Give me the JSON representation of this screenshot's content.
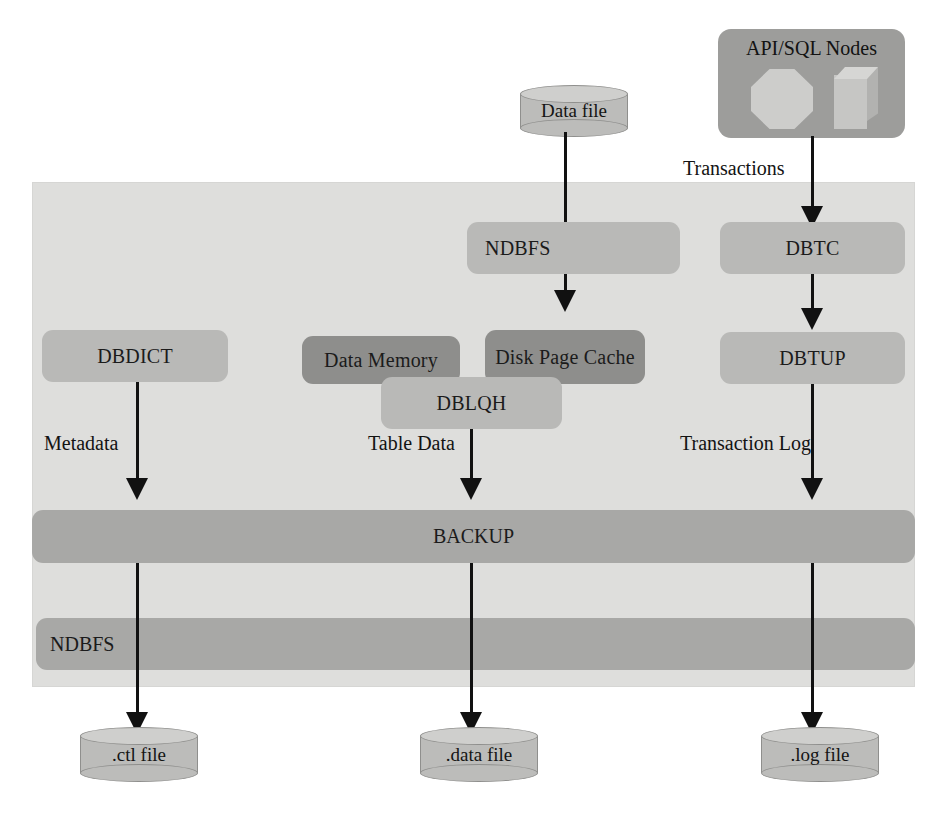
{
  "diagram": {
    "colors": {
      "panel_background": "#dededc",
      "box_light": "#b9b9b7",
      "box_dark": "#8e8e8c",
      "bar": "#a8a8a6",
      "cylinder": "#bcbcba",
      "connector": "#111111"
    }
  },
  "external": {
    "data_file": "Data file",
    "api_sql_nodes": {
      "label": "API/SQL Nodes",
      "glyph_octagon": "octagon-node-icon",
      "glyph_cube": "cube-node-icon"
    }
  },
  "edge_labels": {
    "transactions": "Transactions",
    "metadata": "Metadata",
    "table_data": "Table Data",
    "transaction_log": "Transaction Log"
  },
  "blocks": {
    "ndbfs_top": "NDBFS",
    "dbtc": "DBTC",
    "dbdict": "DBDICT",
    "data_memory": "Data Memory",
    "disk_page_cache": "Disk Page Cache",
    "dblqh": "DBLQH",
    "dbtup": "DBTUP",
    "backup": "BACKUP",
    "ndbfs_bottom": "NDBFS"
  },
  "output_files": {
    "ctl": ".ctl file",
    "data": ".data file",
    "log": ".log file"
  }
}
